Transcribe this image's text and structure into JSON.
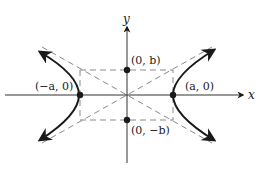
{
  "figure": {
    "type": "hyperbola-diagram",
    "axes": {
      "x_label": "x",
      "y_label": "y"
    },
    "points": [
      {
        "id": "vertex-left",
        "label": "(−a, 0)"
      },
      {
        "id": "vertex-right",
        "label": "(a, 0)"
      },
      {
        "id": "covertex-top",
        "label": "(0, b)"
      },
      {
        "id": "covertex-bottom",
        "label": "(0, −b)"
      }
    ],
    "colors": {
      "curve": "#1a1a1a",
      "axes": "#333333",
      "dashed": "#8a8a8a",
      "points": "#1a1a1a"
    }
  }
}
